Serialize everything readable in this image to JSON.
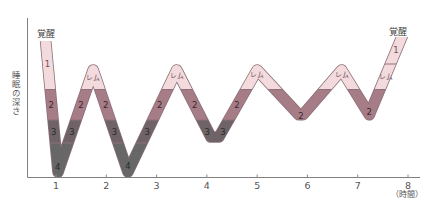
{
  "chart_data": {
    "type": "line",
    "subtype": "hypnogram",
    "title": "",
    "xlabel": "（時間）",
    "ylabel": "睡眠の深さ",
    "y_top_label": "覚醒",
    "x_ticks": [
      "1",
      "2",
      "3",
      "4",
      "5",
      "6",
      "7",
      "8"
    ],
    "xlim": [
      0.4,
      8.25
    ],
    "y_levels_top_to_bottom": [
      "覚醒",
      "レム / 1",
      "2",
      "3",
      "4"
    ],
    "grid": false,
    "legend": null,
    "series": [
      {
        "name": "睡眠の深さ",
        "points": [
          {
            "x": 0.79,
            "stage": "awake"
          },
          {
            "x": 1.04,
            "stage": "4"
          },
          {
            "x": 1.74,
            "stage": "REM"
          },
          {
            "x": 2.43,
            "stage": "4"
          },
          {
            "x": 3.4,
            "stage": "REM"
          },
          {
            "x": 4.08,
            "stage": "3"
          },
          {
            "x": 4.24,
            "stage": "3"
          },
          {
            "x": 5.0,
            "stage": "REM"
          },
          {
            "x": 5.83,
            "stage": "2"
          },
          {
            "x": 5.91,
            "stage": "2"
          },
          {
            "x": 6.68,
            "stage": "REM"
          },
          {
            "x": 7.23,
            "stage": "2"
          },
          {
            "x": 7.86,
            "stage": "awake"
          }
        ]
      }
    ],
    "stage_colors": {
      "light": "#f2dadd",
      "2": "#a67c87",
      "3": "#6e6467",
      "4": "#676767",
      "outline": "#8d7078"
    },
    "label_colors": {
      "light": "#6b4f57",
      "2": "#3b262c",
      "dark": "#2b2b2b"
    },
    "annotations": [
      {
        "text": "1",
        "stage": "1",
        "pos": [
          47.5,
          64
        ]
      },
      {
        "text": "2",
        "stage": "2",
        "pos": [
          51.3,
          105
        ]
      },
      {
        "text": "3",
        "stage": "3",
        "pos": [
          53.8,
          131.5
        ]
      },
      {
        "text": "4",
        "stage": "4",
        "pos": [
          57.6,
          166.5
        ]
      },
      {
        "text": "3",
        "stage": "3",
        "pos": [
          72,
          131.5
        ]
      },
      {
        "text": "2",
        "stage": "2",
        "pos": [
          81,
          105
        ]
      },
      {
        "text": "レム",
        "stage": "REM",
        "pos": [
          93.3,
          77.5
        ]
      },
      {
        "text": "2",
        "stage": "2",
        "pos": [
          105.8,
          105
        ]
      },
      {
        "text": "3",
        "stage": "3",
        "pos": [
          114.5,
          131.5
        ]
      },
      {
        "text": "4",
        "stage": "4",
        "pos": [
          128,
          166
        ]
      },
      {
        "text": "3",
        "stage": "3",
        "pos": [
          147.3,
          131.5
        ]
      },
      {
        "text": "2",
        "stage": "2",
        "pos": [
          159.6,
          105
        ]
      },
      {
        "text": "レム",
        "stage": "REM",
        "pos": [
          176.7,
          76
        ]
      },
      {
        "text": "2",
        "stage": "2",
        "pos": [
          194.8,
          105
        ]
      },
      {
        "text": "3",
        "stage": "3",
        "pos": [
          207.3,
          131.5
        ]
      },
      {
        "text": "3",
        "stage": "3",
        "pos": [
          223,
          131.5
        ]
      },
      {
        "text": "2",
        "stage": "2",
        "pos": [
          237,
          105
        ]
      },
      {
        "text": "レム",
        "stage": "REM",
        "pos": [
          257.3,
          75
        ]
      },
      {
        "text": "2",
        "stage": "2",
        "pos": [
          301,
          116
        ]
      },
      {
        "text": "レム",
        "stage": "REM",
        "pos": [
          341.7,
          74.5
        ]
      },
      {
        "text": "2",
        "stage": "2",
        "pos": [
          369.3,
          112
        ]
      },
      {
        "text": "レム",
        "stage": "REM",
        "pos": [
          385.5,
          77
        ]
      },
      {
        "text": "1",
        "stage": "1",
        "pos": [
          396,
          50
        ]
      }
    ]
  }
}
